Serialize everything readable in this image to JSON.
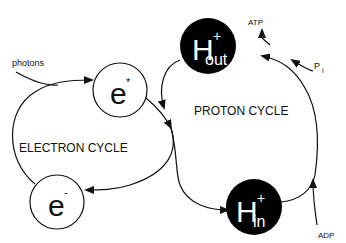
{
  "diagram": {
    "labels": {
      "photons": "photons",
      "electron_cycle": "ELECTRON CYCLE",
      "proton_cycle": "PROTON CYCLE",
      "atp": "ATP",
      "pi_main": "P",
      "pi_sub": "i",
      "adp": "ADP"
    },
    "nodes": {
      "e_star": {
        "base": "e",
        "sup": "*"
      },
      "e_minus": {
        "base": "e",
        "sup": "-"
      },
      "h_out": {
        "base": "H",
        "sup": "+",
        "sub": "out"
      },
      "h_in": {
        "base": "H",
        "sup": "+",
        "sub": "in"
      }
    },
    "colors": {
      "line": "#111111",
      "proton_fill": "#000000",
      "electron_fill": "#ffffff"
    }
  }
}
